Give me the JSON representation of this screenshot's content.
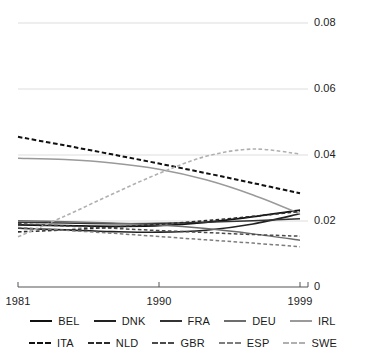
{
  "chart_data": {
    "type": "line",
    "title": "",
    "xlabel": "",
    "ylabel": "",
    "xlim": [
      1981,
      1999
    ],
    "ylim": [
      0,
      0.08
    ],
    "grid": true,
    "gridlines_y": [
      0,
      0.02,
      0.04,
      0.06,
      0.08
    ],
    "x_ticks": [
      1981,
      1990,
      1999
    ],
    "x_tick_labels": [
      "1981",
      "1990",
      "1999"
    ],
    "y_tick_labels": [
      "0",
      "0.02",
      "0.04",
      "0.06",
      "0.08"
    ],
    "legend_position": "bottom",
    "x": [
      1981,
      1984,
      1987,
      1990,
      1993,
      1996,
      1999
    ],
    "series": [
      {
        "name": "BEL",
        "style": "solid",
        "color": "#111111",
        "width": 1.7,
        "values": [
          0.0188,
          0.0186,
          0.0184,
          0.0186,
          0.0196,
          0.0213,
          0.0233
        ]
      },
      {
        "name": "DNK",
        "style": "solid",
        "color": "#222222",
        "width": 1.7,
        "values": [
          0.0178,
          0.0173,
          0.0168,
          0.0166,
          0.0172,
          0.0191,
          0.0222
        ]
      },
      {
        "name": "FRA",
        "style": "solid",
        "color": "#333333",
        "width": 1.5,
        "values": [
          0.0196,
          0.0194,
          0.0192,
          0.0193,
          0.0196,
          0.0201,
          0.0207
        ]
      },
      {
        "name": "DEU",
        "style": "solid",
        "color": "#6d6d6d",
        "width": 1.5,
        "values": [
          0.0201,
          0.0198,
          0.0194,
          0.0188,
          0.0177,
          0.0161,
          0.0142
        ]
      },
      {
        "name": "IRL",
        "style": "solid",
        "color": "#9a9a9a",
        "width": 1.5,
        "values": [
          0.039,
          0.0386,
          0.0376,
          0.0357,
          0.0325,
          0.0279,
          0.0222
        ]
      },
      {
        "name": "ITA",
        "style": "dashed",
        "color": "#111111",
        "width": 2.0,
        "values": [
          0.0455,
          0.0429,
          0.0402,
          0.0374,
          0.0345,
          0.0315,
          0.0284
        ]
      },
      {
        "name": "NLD",
        "style": "dashed",
        "color": "#2b2b2b",
        "width": 1.6,
        "values": [
          0.0167,
          0.0173,
          0.0181,
          0.019,
          0.0201,
          0.0214,
          0.0229
        ]
      },
      {
        "name": "GBR",
        "style": "dashed",
        "color": "#4a4a4a",
        "width": 1.5,
        "values": [
          0.0192,
          0.0185,
          0.0178,
          0.0171,
          0.0165,
          0.0159,
          0.0154
        ]
      },
      {
        "name": "ESP",
        "style": "dashed",
        "color": "#7d7d7d",
        "width": 1.5,
        "values": [
          0.018,
          0.0172,
          0.0163,
          0.0153,
          0.0143,
          0.0133,
          0.0122
        ]
      },
      {
        "name": "SWE",
        "style": "dashed",
        "color": "#b0b0b0",
        "width": 1.6,
        "values": [
          0.0152,
          0.0215,
          0.0281,
          0.0344,
          0.0396,
          0.0418,
          0.0403
        ]
      }
    ]
  },
  "legend": {
    "row1": [
      {
        "label": "BEL",
        "style": "solid",
        "color": "#111111"
      },
      {
        "label": "DNK",
        "style": "solid",
        "color": "#222222"
      },
      {
        "label": "FRA",
        "style": "solid",
        "color": "#333333"
      },
      {
        "label": "DEU",
        "style": "solid",
        "color": "#6d6d6d"
      },
      {
        "label": "IRL",
        "style": "solid",
        "color": "#9a9a9a"
      }
    ],
    "row2": [
      {
        "label": "ITA",
        "style": "dashed",
        "color": "#111111"
      },
      {
        "label": "NLD",
        "style": "dashed",
        "color": "#2b2b2b"
      },
      {
        "label": "GBR",
        "style": "dashed",
        "color": "#4a4a4a"
      },
      {
        "label": "ESP",
        "style": "dashed",
        "color": "#7d7d7d"
      },
      {
        "label": "SWE",
        "style": "dashed",
        "color": "#b0b0b0"
      }
    ]
  },
  "colors": {
    "gridline": "#d9d9d9",
    "axis": "#555555",
    "text": "#1a1a1a",
    "background": "#ffffff"
  }
}
